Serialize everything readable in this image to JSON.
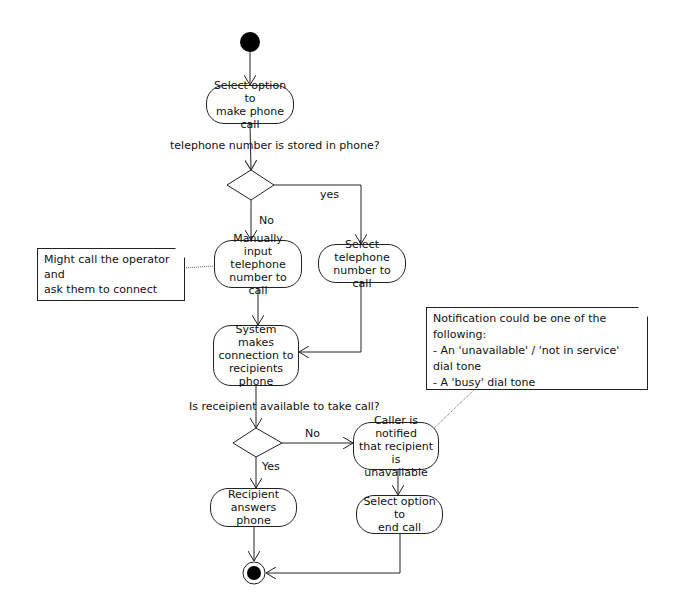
{
  "diagram": {
    "type": "UML activity diagram",
    "actions": {
      "select_make_call": "Select option to\nmake phone call",
      "manual_input": "Manually input\ntelephone\nnumber to call",
      "select_number": "Select telephone\nnumber to call",
      "system_connects": "System makes\nconnection to\nrecipients phone",
      "caller_notified": "Caller is notified\nthat recipient is\nunavailable",
      "recipient_answers": "Recipient\nanswers phone",
      "select_end_call": "Select option to\nend call"
    },
    "guards": {
      "stored_question": "telephone number is stored in phone?",
      "yes1": "yes",
      "no1": "No",
      "available_question": "Is receipient available to take call?",
      "no2": "No",
      "yes2": "Yes"
    },
    "notes": {
      "operator": "Might call the operator and\nask them to connect\nto the recipients phone",
      "notification": "Notification could be one of the following:\n- An 'unavailable' / 'not in service' dial tone\n- A 'busy' dial tone\n- A pre-recorded message\netc."
    },
    "colors": {
      "line": "#222222",
      "node_fill": "#000000",
      "background": "#ffffff"
    }
  }
}
